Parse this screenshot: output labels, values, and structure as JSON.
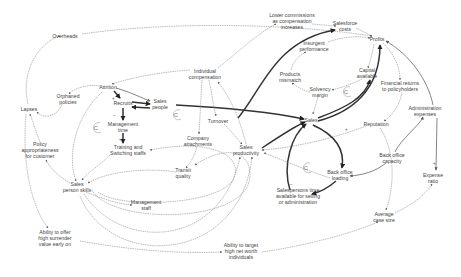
{
  "diagram": {
    "type": "causal-loop-diagram",
    "nodes": [
      {
        "id": "overheads",
        "label": "Overheads",
        "x": 65,
        "y": 36
      },
      {
        "id": "lower_commissions",
        "label": "Lower commissions|as compensation|increases",
        "x": 292,
        "y": 21
      },
      {
        "id": "salesforce_costs",
        "label": "Salesforce|costs",
        "x": 345,
        "y": 26
      },
      {
        "id": "profits",
        "label": "Profits",
        "x": 377,
        "y": 39
      },
      {
        "id": "insurgent_performance",
        "label": "Insurgent|performance",
        "x": 314,
        "y": 46
      },
      {
        "id": "capital_available",
        "label": "Capital|available",
        "x": 367,
        "y": 73
      },
      {
        "id": "products_mismatch",
        "label": "Products|mismatch",
        "x": 290,
        "y": 77
      },
      {
        "id": "solvency_margin",
        "label": "Solvency|margin",
        "x": 320,
        "y": 92
      },
      {
        "id": "financial_returns",
        "label": "Financial returns|to policyholders",
        "x": 400,
        "y": 86
      },
      {
        "id": "individual_compensation",
        "label": "Individual|compensation",
        "x": 205,
        "y": 74
      },
      {
        "id": "attrition",
        "label": "Attrition",
        "x": 108,
        "y": 87
      },
      {
        "id": "orphaned_policies",
        "label": "Orphaned|policies",
        "x": 68,
        "y": 99
      },
      {
        "id": "lapses",
        "label": "Lapses",
        "x": 29,
        "y": 109
      },
      {
        "id": "recruits",
        "label": "Recruits",
        "x": 123,
        "y": 103
      },
      {
        "id": "sales_people",
        "label": "Sales|people",
        "x": 160,
        "y": 104
      },
      {
        "id": "management_time",
        "label": "Management|time",
        "x": 123,
        "y": 127
      },
      {
        "id": "administration_expenses",
        "label": "Administration|expenses",
        "x": 425,
        "y": 111
      },
      {
        "id": "reputation",
        "label": "Reputation",
        "x": 376,
        "y": 124
      },
      {
        "id": "sales",
        "label": "Sales",
        "x": 311,
        "y": 120
      },
      {
        "id": "turnover",
        "label": "Turnover",
        "x": 218,
        "y": 121
      },
      {
        "id": "company_attachments",
        "label": "Company|attachments",
        "x": 198,
        "y": 141
      },
      {
        "id": "training_skills",
        "label": "Training and|Switching staffs",
        "x": 128,
        "y": 150
      },
      {
        "id": "sales_productivity",
        "label": "Sales|productivity",
        "x": 246,
        "y": 150
      },
      {
        "id": "poor_appropriateness",
        "label": "Policy|appropriateness|for customer",
        "x": 40,
        "y": 150
      },
      {
        "id": "back_office_capacity",
        "label": "Back office|capacity",
        "x": 392,
        "y": 158
      },
      {
        "id": "expense_ratio",
        "label": "Expense|ratio",
        "x": 433,
        "y": 178
      },
      {
        "id": "transit_quality",
        "label": "Transit|quality",
        "x": 183,
        "y": 173
      },
      {
        "id": "back_office_loading",
        "label": "Back office|loading",
        "x": 340,
        "y": 175
      },
      {
        "id": "sales_person_skills",
        "label": "Sales|person skills",
        "x": 77,
        "y": 187
      },
      {
        "id": "salesperson_time",
        "label": "Salespersons time|available for selling|or administration",
        "x": 298,
        "y": 196
      },
      {
        "id": "management_staff",
        "label": "Management|staff",
        "x": 146,
        "y": 205
      },
      {
        "id": "average_case_size",
        "label": "Average|case size",
        "x": 384,
        "y": 217
      },
      {
        "id": "ability_high_value",
        "label": "Ability to offer|high surrender|value early on",
        "x": 55,
        "y": 238
      },
      {
        "id": "ability_target",
        "label": "Ability to target|high net worth|individuals",
        "x": 241,
        "y": 251
      }
    ],
    "loop_markers": [
      {
        "label": "C",
        "x": 96,
        "y": 128
      },
      {
        "label": "C",
        "x": 176,
        "y": 115
      },
      {
        "label": "C",
        "x": 346,
        "y": 92
      },
      {
        "label": "C",
        "x": 306,
        "y": 168
      }
    ],
    "signs": [
      {
        "label": "+",
        "x": 112,
        "y": 100
      },
      {
        "label": "–",
        "x": 113,
        "y": 117
      },
      {
        "label": "+",
        "x": 119,
        "y": 141
      },
      {
        "label": "+",
        "x": 345,
        "y": 131
      },
      {
        "label": "+",
        "x": 314,
        "y": 128
      },
      {
        "label": "–",
        "x": 290,
        "y": 186
      },
      {
        "label": "+",
        "x": 433,
        "y": 165
      }
    ]
  }
}
